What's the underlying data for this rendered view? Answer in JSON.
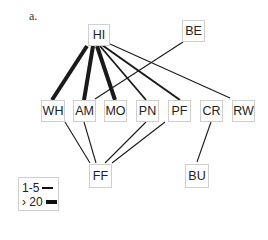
{
  "panel_label": "a.",
  "nodes": {
    "HI": {
      "label": "HI"
    },
    "BE": {
      "label": "BE"
    },
    "WH": {
      "label": "WH"
    },
    "AM": {
      "label": "AM"
    },
    "MO": {
      "label": "MO"
    },
    "PN": {
      "label": "PN"
    },
    "PF": {
      "label": "PF"
    },
    "CR": {
      "label": "CR"
    },
    "RW": {
      "label": "RW"
    },
    "FF": {
      "label": "FF"
    },
    "BU": {
      "label": "BU"
    }
  },
  "edges": [
    {
      "from": "HI",
      "to": "WH",
      "weight": "> 20"
    },
    {
      "from": "HI",
      "to": "AM",
      "weight": "> 20"
    },
    {
      "from": "HI",
      "to": "MO",
      "weight": "> 20"
    },
    {
      "from": "HI",
      "to": "PN",
      "weight": "medium"
    },
    {
      "from": "HI",
      "to": "PF",
      "weight": "medium"
    },
    {
      "from": "HI",
      "to": "RW",
      "weight": "1-5"
    },
    {
      "from": "BE",
      "to": "AM",
      "weight": "1-5"
    },
    {
      "from": "WH",
      "to": "FF",
      "weight": "1-5"
    },
    {
      "from": "AM",
      "to": "FF",
      "weight": "1-5"
    },
    {
      "from": "PN",
      "to": "FF",
      "weight": "1-5"
    },
    {
      "from": "PF",
      "to": "FF",
      "weight": "1-5"
    },
    {
      "from": "CR",
      "to": "BU",
      "weight": "1-5"
    }
  ],
  "legend": {
    "thin_label": "1-5",
    "thick_label": "› 20"
  }
}
